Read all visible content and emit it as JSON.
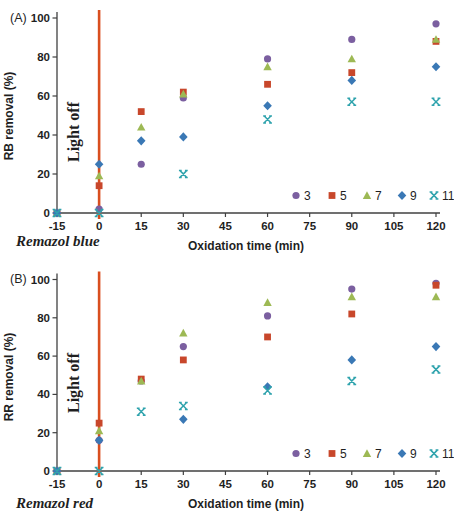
{
  "colors": {
    "light_line": "#D94E1F",
    "axis": "#404040",
    "text": "#1F1F1F"
  },
  "chart_data": [
    {
      "type": "scatter",
      "panel_label": "(A)",
      "ylabel": "RB removal (%)",
      "xlabel": "Oxidation time (min)",
      "caption": "Remazol blue",
      "annotation": "Light off",
      "xlim": [
        -15,
        120
      ],
      "ylim": [
        0,
        100
      ],
      "xticks": [
        -15,
        0,
        15,
        30,
        45,
        60,
        75,
        90,
        105,
        120
      ],
      "yticks": [
        0,
        20,
        40,
        60,
        80,
        100
      ],
      "grid": false,
      "legend_position": "inside-bottom-right",
      "light_line_x": 0,
      "x": [
        -15,
        0,
        15,
        30,
        60,
        90,
        120
      ],
      "series": [
        {
          "name": "3",
          "marker": "circle",
          "color": "#7B5FA0",
          "values": [
            0,
            2,
            25,
            59,
            79,
            89,
            97
          ]
        },
        {
          "name": "5",
          "marker": "square",
          "color": "#C8472B",
          "values": [
            0,
            14,
            52,
            62,
            66,
            72,
            88
          ]
        },
        {
          "name": "7",
          "marker": "triangle",
          "color": "#9DB954",
          "values": [
            0,
            19,
            44,
            61,
            75,
            79,
            89
          ]
        },
        {
          "name": "9",
          "marker": "diamond",
          "color": "#3A78B5",
          "values": [
            0,
            25,
            37,
            39,
            55,
            68,
            75
          ]
        },
        {
          "name": "11",
          "marker": "xmark",
          "color": "#2FA3AD",
          "values": [
            0,
            0,
            null,
            20,
            48,
            57,
            57
          ]
        }
      ]
    },
    {
      "type": "scatter",
      "panel_label": "(B)",
      "ylabel": "RR removal (%)",
      "xlabel": "Oxidation time (min)",
      "caption": "Remazol red",
      "annotation": "Light off",
      "xlim": [
        -15,
        120
      ],
      "ylim": [
        0,
        100
      ],
      "xticks": [
        -15,
        0,
        15,
        30,
        45,
        60,
        75,
        90,
        105,
        120
      ],
      "yticks": [
        0,
        20,
        40,
        60,
        80,
        100
      ],
      "grid": false,
      "legend_position": "inside-bottom-right",
      "light_line_x": 0,
      "x": [
        -15,
        0,
        15,
        30,
        60,
        90,
        120
      ],
      "series": [
        {
          "name": "3",
          "marker": "circle",
          "color": "#7B5FA0",
          "values": [
            0,
            16,
            47,
            65,
            81,
            95,
            98
          ]
        },
        {
          "name": "5",
          "marker": "square",
          "color": "#C8472B",
          "values": [
            0,
            25,
            48,
            58,
            70,
            82,
            97
          ]
        },
        {
          "name": "7",
          "marker": "triangle",
          "color": "#9DB954",
          "values": [
            0,
            21,
            47,
            72,
            88,
            91,
            91
          ]
        },
        {
          "name": "9",
          "marker": "diamond",
          "color": "#3A78B5",
          "values": [
            0,
            16,
            null,
            27,
            44,
            58,
            65
          ]
        },
        {
          "name": "11",
          "marker": "xmark",
          "color": "#2FA3AD",
          "values": [
            0,
            0,
            31,
            34,
            42,
            47,
            53
          ]
        }
      ]
    }
  ]
}
